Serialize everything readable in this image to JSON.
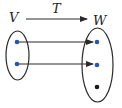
{
  "diagram": {
    "domain_label": "V",
    "codomain_label": "W",
    "map_label": "T",
    "colors": {
      "stroke": "#2a2a2a",
      "mapped_dot": "#2457b0",
      "unmapped_dot": "#1a1a1a",
      "background": "#ffffff"
    },
    "domain_points": [
      {
        "id": "v1",
        "color": "blue"
      },
      {
        "id": "v2",
        "color": "blue"
      }
    ],
    "codomain_points": [
      {
        "id": "w1",
        "color": "blue"
      },
      {
        "id": "w2",
        "color": "blue"
      },
      {
        "id": "w3",
        "color": "black"
      }
    ],
    "mappings": [
      {
        "from": "v1",
        "to": "w1"
      },
      {
        "from": "v2",
        "to": "w2"
      }
    ]
  }
}
